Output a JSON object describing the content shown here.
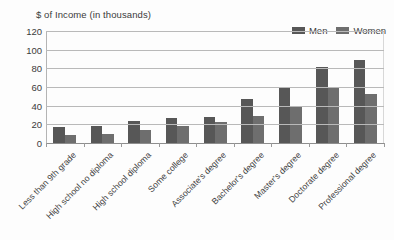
{
  "chart_data": {
    "type": "bar",
    "title": "$ of Income (in thousands)",
    "xlabel": "",
    "ylabel": "",
    "ylim": [
      0,
      120
    ],
    "yticks": [
      0,
      20,
      40,
      60,
      80,
      100,
      120
    ],
    "grid": true,
    "legend_position": "top-right",
    "categories": [
      "Less than 9th grade",
      "High school no diploma",
      "High school diploma",
      "Some college",
      "Associate's degree",
      "Bachelor's degree",
      "Master's degree",
      "Doctorate degree",
      "Professional degree"
    ],
    "series": [
      {
        "name": "Men",
        "color": "#575757",
        "values": [
          17,
          18,
          24,
          27,
          28,
          47,
          60,
          81,
          89
        ]
      },
      {
        "name": "Women",
        "color": "#6e6e6e",
        "values": [
          9,
          10,
          14,
          18,
          23,
          29,
          40,
          60,
          53
        ]
      }
    ]
  },
  "colors": {
    "men": "#575757",
    "women": "#6e6e6e",
    "gridline": "#b9b9b9",
    "axis": "#8e8e8e",
    "text": "#3b3b3b",
    "background": "#fdfdfd"
  }
}
